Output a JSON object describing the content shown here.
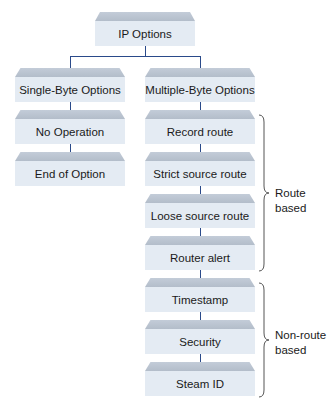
{
  "root": {
    "label": "IP Options"
  },
  "left_branch": {
    "header": "Single-Byte Options",
    "items": [
      "No Operation",
      "End of Option"
    ]
  },
  "right_branch": {
    "header": "Multiple-Byte Options",
    "items": [
      "Record route",
      "Strict source route",
      "Loose source route",
      "Router alert",
      "Timestamp",
      "Security",
      "Steam ID"
    ]
  },
  "groups": [
    {
      "label_line1": "Route",
      "label_line2": "based"
    },
    {
      "label_line1": "Non-route",
      "label_line2": "based"
    }
  ],
  "colors": {
    "box_face": "#e4ebf3",
    "box_bevel": "#b8c2cf",
    "connector": "#2a4a8a"
  }
}
